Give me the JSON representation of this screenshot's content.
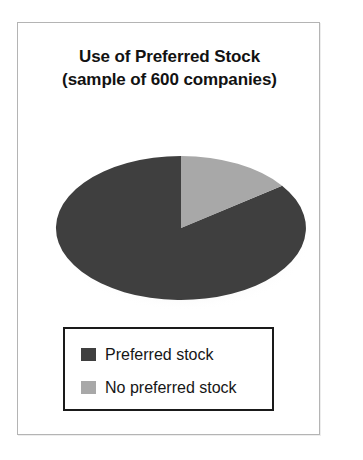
{
  "figure": {
    "title_line1": "Use of Preferred Stock",
    "title_line2": "(sample of 600 companies)"
  },
  "legend": {
    "items": [
      {
        "label": "Preferred stock",
        "swatch_name": "legend-swatch-preferred-stock",
        "color": "#3f3f3f"
      },
      {
        "label": "No preferred stock",
        "swatch_name": "legend-swatch-no-preferred-stock",
        "color": "#a8a8a8"
      }
    ]
  },
  "chart_data": {
    "type": "pie",
    "title": "Use of Preferred Stock (sample of 600 companies)",
    "subtitle": "sample of 600 companies",
    "sample_size": 600,
    "labels": [
      "Preferred stock",
      "No preferred stock"
    ],
    "values": [
      85,
      15
    ],
    "value_unit": "percent",
    "counts": [
      510,
      90
    ],
    "colors": [
      "#3f3f3f",
      "#a8a8a8"
    ],
    "start_angle_deg": 0,
    "direction": "clockwise",
    "legend_position": "bottom",
    "grid": false,
    "data_labels": false,
    "style": "flattened-ellipse-with-shadow"
  }
}
